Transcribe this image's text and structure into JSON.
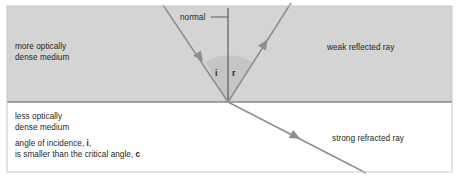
{
  "figure": {
    "background_color": "#ffffff",
    "upper_medium_fill": "#d4d4d4",
    "lower_medium_fill": "#ffffff",
    "ray_color": "#8d8d8d",
    "line_color": "#5a5a5a",
    "text_color": "#231f20",
    "angle_wedge_fill": "#c2c2c2"
  },
  "labels": {
    "dense_medium": "more optically\ndense medium",
    "less_dense_medium": "less optically\ndense medium",
    "normal": "normal",
    "weak_reflected_ray": "weak reflected ray",
    "strong_refracted_ray": "strong refracted ray",
    "angle_incidence": "i",
    "angle_reflection": "r",
    "critical_note_line1_pre": "angle of incidence, ",
    "critical_note_line1_sym": "i",
    "critical_note_line1_post": ",",
    "critical_note_line2_pre": "is smaller than the critical angle, ",
    "critical_note_line2_sym": "c"
  },
  "geometry": {
    "boundary_y": 102,
    "origin_x": 228,
    "origin_y": 102,
    "normal_top_y": 8,
    "incident_ray_start": [
      163,
      5
    ],
    "reflected_ray_end": [
      291,
      3
    ],
    "refracted_ray_end": [
      366,
      173
    ],
    "gray_region": {
      "x": 7,
      "y": 6,
      "width": 445,
      "height": 96
    },
    "frame": {
      "x": 7,
      "y": 6,
      "width": 445,
      "height": 166
    }
  }
}
